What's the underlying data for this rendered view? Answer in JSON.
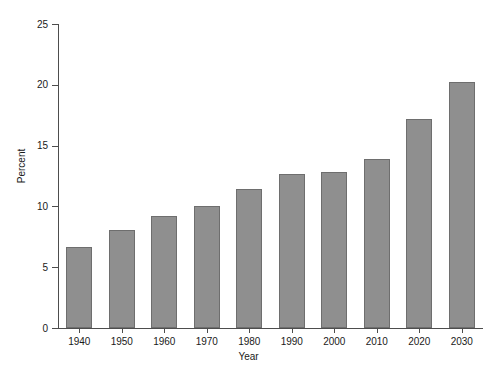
{
  "chart_data": {
    "type": "bar",
    "title": "",
    "subtitle": "",
    "xlabel": "Year",
    "ylabel": "Percent",
    "categories": [
      "1940",
      "1950",
      "1960",
      "1970",
      "1980",
      "1990",
      "2000",
      "2010",
      "2020",
      "2030"
    ],
    "values": [
      6.7,
      8.1,
      9.2,
      10.0,
      11.4,
      12.7,
      12.8,
      13.9,
      17.2,
      20.2
    ],
    "series": [
      {
        "name": "Percent",
        "values": [
          6.7,
          8.1,
          9.2,
          10.0,
          11.4,
          12.7,
          12.8,
          13.9,
          17.2,
          20.2
        ]
      }
    ],
    "ylim": [
      0,
      25
    ],
    "yticks": [
      0,
      5,
      10,
      15,
      20,
      25
    ],
    "ytick_labels": [
      "0",
      "5",
      "10",
      "15",
      "20",
      "25"
    ],
    "xtick_labels": [
      "1940",
      "1950",
      "1960",
      "1970",
      "1980",
      "1990",
      "2000",
      "2010",
      "2020",
      "2030"
    ],
    "grid": false,
    "legend": false,
    "legend_position": "none",
    "bar_color": "#8f8f8f",
    "bar_edge_color": "#6e6e6e",
    "axis_color": "#4d4d4d",
    "background_color": "#ffffff",
    "text_color": "#1a1a1a",
    "annotations": []
  }
}
